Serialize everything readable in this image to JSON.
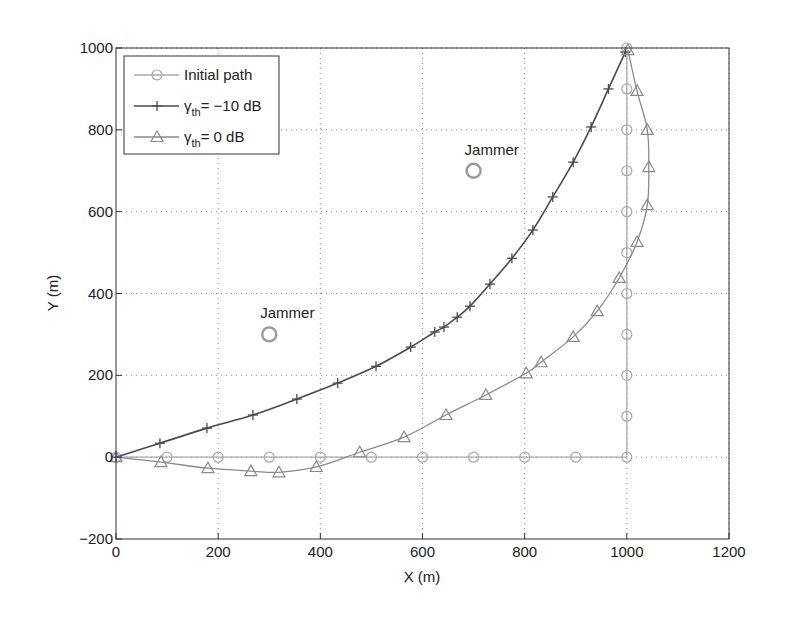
{
  "chart_data": {
    "type": "line",
    "title": "",
    "xlabel": "X (m)",
    "ylabel": "Y (m)",
    "xlim": [
      0,
      1200
    ],
    "ylim": [
      -200,
      1000
    ],
    "xticks": [
      0,
      200,
      400,
      600,
      800,
      1000,
      1200
    ],
    "yticks": [
      -200,
      0,
      200,
      400,
      600,
      800,
      1000
    ],
    "grid": true,
    "legend_position": "upper-left",
    "series": [
      {
        "name": "Initial path",
        "legend_main": "Initial path",
        "legend_sub": "",
        "legend_suffix": "",
        "marker": "circle",
        "color": "#a8a8a8",
        "points": [
          [
            0,
            0
          ],
          [
            100,
            0
          ],
          [
            200,
            0
          ],
          [
            300,
            0
          ],
          [
            400,
            0
          ],
          [
            500,
            0
          ],
          [
            600,
            0
          ],
          [
            700,
            0
          ],
          [
            800,
            0
          ],
          [
            900,
            0
          ],
          [
            1000,
            0
          ],
          [
            1000,
            100
          ],
          [
            1000,
            200
          ],
          [
            1000,
            300
          ],
          [
            1000,
            400
          ],
          [
            1000,
            500
          ],
          [
            1000,
            600
          ],
          [
            1000,
            700
          ],
          [
            1000,
            800
          ],
          [
            1000,
            900
          ],
          [
            1000,
            1000
          ]
        ]
      },
      {
        "name": "γth = −10 dB",
        "legend_main": "γ",
        "legend_sub": "th",
        "legend_suffix": "= −10 dB",
        "marker": "plus",
        "color": "#4a4a4a",
        "points": [
          [
            0,
            0
          ],
          [
            86,
            34
          ],
          [
            178,
            71
          ],
          [
            268,
            103
          ],
          [
            354,
            142
          ],
          [
            434,
            181
          ],
          [
            509,
            222
          ],
          [
            577,
            269
          ],
          [
            624,
            306
          ],
          [
            642,
            318
          ],
          [
            668,
            342
          ],
          [
            693,
            369
          ],
          [
            732,
            423
          ],
          [
            775,
            486
          ],
          [
            816,
            555
          ],
          [
            855,
            636
          ],
          [
            895,
            721
          ],
          [
            930,
            807
          ],
          [
            964,
            900
          ],
          [
            997,
            990
          ]
        ]
      },
      {
        "name": "γth = 0 dB",
        "legend_main": "γ",
        "legend_sub": "th",
        "legend_suffix": "= 0 dB",
        "marker": "triangle",
        "color": "#8a8a8a",
        "points": [
          [
            0,
            0
          ],
          [
            88,
            -12
          ],
          [
            180,
            -27
          ],
          [
            264,
            -34
          ],
          [
            319,
            -37
          ],
          [
            392,
            -24
          ],
          [
            477,
            12
          ],
          [
            564,
            49
          ],
          [
            646,
            103
          ],
          [
            724,
            152
          ],
          [
            803,
            205
          ],
          [
            832,
            232
          ],
          [
            895,
            294
          ],
          [
            942,
            357
          ],
          [
            985,
            438
          ],
          [
            1020,
            526
          ],
          [
            1040,
            616
          ],
          [
            1043,
            709
          ],
          [
            1040,
            800
          ],
          [
            1020,
            895
          ],
          [
            1002,
            995
          ]
        ]
      }
    ],
    "annotations": [
      {
        "text": "Jammer",
        "marker": "circle",
        "x": 300,
        "y": 300
      },
      {
        "text": "Jammer",
        "marker": "circle",
        "x": 700,
        "y": 700
      }
    ]
  }
}
